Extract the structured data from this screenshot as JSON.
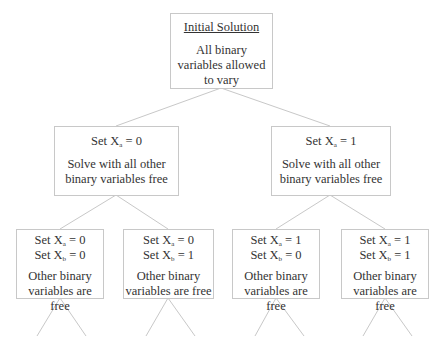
{
  "colors": {
    "line": "#c8c8c8",
    "text": "#333333",
    "background": "#ffffff"
  },
  "root": {
    "title": "Initial Solution",
    "body": [
      "All binary",
      "variables allowed",
      "to vary"
    ]
  },
  "level1": [
    {
      "set": [
        {
          "var": "X",
          "sub": "a",
          "val": " = 0"
        }
      ],
      "body": [
        "Solve with all other",
        "binary variables free"
      ]
    },
    {
      "set": [
        {
          "var": "X",
          "sub": "a",
          "val": " = 1"
        }
      ],
      "body": [
        "Solve with all other",
        "binary variables free"
      ]
    }
  ],
  "level2": [
    {
      "set": [
        {
          "var": "X",
          "sub": "a",
          "val": " = 0"
        },
        {
          "var": "X",
          "sub": "b",
          "val": " = 0"
        }
      ],
      "body": [
        "Other binary",
        "variables are free"
      ]
    },
    {
      "set": [
        {
          "var": "X",
          "sub": "a",
          "val": " = 0"
        },
        {
          "var": "X",
          "sub": "b",
          "val": " = 1"
        }
      ],
      "body": [
        "Other binary",
        "variables are free"
      ]
    },
    {
      "set": [
        {
          "var": "X",
          "sub": "a",
          "val": " = 1"
        },
        {
          "var": "X",
          "sub": "b",
          "val": " = 0"
        }
      ],
      "body": [
        "Other binary",
        "variables are free"
      ]
    },
    {
      "set": [
        {
          "var": "X",
          "sub": "a",
          "val": " = 1"
        },
        {
          "var": "X",
          "sub": "b",
          "val": " = 1"
        }
      ],
      "body": [
        "Other binary",
        "variables are free"
      ]
    }
  ],
  "set_prefix": "Set "
}
